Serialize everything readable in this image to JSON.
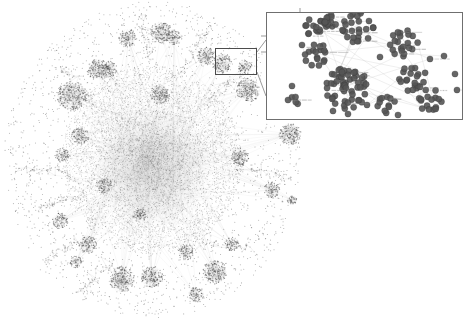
{
  "figure": {
    "background_color": "#ffffff",
    "node_color": "#4a4a4a",
    "edge_color": "#9a9a9a",
    "inset_border_color": "#6f6f6f",
    "selection_border_color": "#4c4c4c",
    "connector_color": "#6f6f6f",
    "caption": "",
    "width": 474,
    "height": 320
  },
  "main_graph": {
    "name": "main-network-hairball",
    "center_x": 152,
    "center_y": 160,
    "core_radius": 78,
    "node_count": 9000,
    "edge_count": 14000,
    "satellite_clusters": [
      {
        "x": 72,
        "y": 96,
        "r": 15,
        "n": 190
      },
      {
        "x": 98,
        "y": 70,
        "r": 11,
        "n": 120
      },
      {
        "x": 128,
        "y": 38,
        "r": 9,
        "n": 85
      },
      {
        "x": 161,
        "y": 32,
        "r": 11,
        "n": 115
      },
      {
        "x": 174,
        "y": 37,
        "r": 8,
        "n": 70
      },
      {
        "x": 206,
        "y": 56,
        "r": 9,
        "n": 85
      },
      {
        "x": 222,
        "y": 63,
        "r": 10,
        "n": 95
      },
      {
        "x": 245,
        "y": 67,
        "r": 7,
        "n": 55
      },
      {
        "x": 248,
        "y": 90,
        "r": 12,
        "n": 140
      },
      {
        "x": 290,
        "y": 134,
        "r": 11,
        "n": 130
      },
      {
        "x": 272,
        "y": 190,
        "r": 8,
        "n": 70
      },
      {
        "x": 292,
        "y": 200,
        "r": 5,
        "n": 35
      },
      {
        "x": 240,
        "y": 157,
        "r": 9,
        "n": 90
      },
      {
        "x": 109,
        "y": 69,
        "r": 8,
        "n": 70
      },
      {
        "x": 80,
        "y": 136,
        "r": 9,
        "n": 80
      },
      {
        "x": 62,
        "y": 155,
        "r": 7,
        "n": 55
      },
      {
        "x": 60,
        "y": 221,
        "r": 8,
        "n": 70
      },
      {
        "x": 88,
        "y": 245,
        "r": 9,
        "n": 85
      },
      {
        "x": 76,
        "y": 262,
        "r": 6,
        "n": 45
      },
      {
        "x": 122,
        "y": 279,
        "r": 13,
        "n": 160
      },
      {
        "x": 152,
        "y": 277,
        "r": 11,
        "n": 125
      },
      {
        "x": 215,
        "y": 272,
        "r": 12,
        "n": 145
      },
      {
        "x": 196,
        "y": 295,
        "r": 8,
        "n": 65
      },
      {
        "x": 186,
        "y": 252,
        "r": 8,
        "n": 70
      },
      {
        "x": 232,
        "y": 244,
        "r": 7,
        "n": 55
      },
      {
        "x": 140,
        "y": 215,
        "r": 7,
        "n": 55
      },
      {
        "x": 104,
        "y": 185,
        "r": 8,
        "n": 65
      },
      {
        "x": 160,
        "y": 95,
        "r": 10,
        "n": 100
      }
    ],
    "filament_tendrils": [
      {
        "x1": 70,
        "y1": 172,
        "x2": 18,
        "y2": 168
      },
      {
        "x1": 78,
        "y1": 196,
        "x2": 36,
        "y2": 206
      },
      {
        "x1": 84,
        "y1": 238,
        "x2": 42,
        "y2": 262
      },
      {
        "x1": 110,
        "y1": 262,
        "x2": 78,
        "y2": 292
      },
      {
        "x1": 190,
        "y1": 246,
        "x2": 254,
        "y2": 246
      },
      {
        "x1": 206,
        "y1": 100,
        "x2": 246,
        "y2": 72
      },
      {
        "x1": 150,
        "y1": 62,
        "x2": 140,
        "y2": 16
      },
      {
        "x1": 182,
        "y1": 72,
        "x2": 210,
        "y2": 24
      },
      {
        "x1": 96,
        "y1": 104,
        "x2": 60,
        "y2": 66
      },
      {
        "x1": 236,
        "y1": 168,
        "x2": 286,
        "y2": 176
      }
    ]
  },
  "inset": {
    "name": "magnified-inset",
    "x": 266,
    "y": 12,
    "width": 197,
    "height": 108,
    "node_radius_px": 3.1,
    "clusters": [
      {
        "id": "c1",
        "x": 314,
        "y": 27,
        "r": 9,
        "n": 13,
        "label": "cluster-top-left"
      },
      {
        "id": "c2",
        "x": 327,
        "y": 26,
        "r": 6,
        "n": 7,
        "label": "cluster-top-left-b"
      },
      {
        "id": "c3",
        "x": 330,
        "y": 22,
        "r": 7,
        "n": 9,
        "label": "cluster-top-mid"
      },
      {
        "id": "c4",
        "x": 358,
        "y": 27,
        "r": 16,
        "n": 26,
        "label": "cluster-top-center"
      },
      {
        "id": "c5",
        "x": 316,
        "y": 55,
        "r": 12,
        "n": 17,
        "label": "cluster-left-mid"
      },
      {
        "id": "c6",
        "x": 404,
        "y": 44,
        "r": 14,
        "n": 21,
        "label": "cluster-right-upper"
      },
      {
        "id": "c7",
        "x": 347,
        "y": 88,
        "r": 21,
        "n": 56,
        "label": "cluster-center-large"
      },
      {
        "id": "c8",
        "x": 413,
        "y": 78,
        "r": 14,
        "n": 20,
        "label": "cluster-right-mid"
      },
      {
        "id": "c9",
        "x": 430,
        "y": 100,
        "r": 12,
        "n": 16,
        "label": "cluster-right-lower"
      },
      {
        "id": "c10",
        "x": 386,
        "y": 104,
        "r": 9,
        "n": 11,
        "label": "cluster-bottom-mid"
      },
      {
        "id": "c11",
        "x": 295,
        "y": 100,
        "r": 5,
        "n": 4,
        "label": "cluster-bottom-left"
      }
    ],
    "free_nodes": [
      {
        "x": 302,
        "y": 45
      },
      {
        "x": 292,
        "y": 86
      },
      {
        "x": 288,
        "y": 100
      },
      {
        "x": 430,
        "y": 59
      },
      {
        "x": 444,
        "y": 56
      },
      {
        "x": 457,
        "y": 90
      },
      {
        "x": 380,
        "y": 57
      },
      {
        "x": 367,
        "y": 105
      },
      {
        "x": 398,
        "y": 115
      },
      {
        "x": 455,
        "y": 74
      },
      {
        "x": 333,
        "y": 111
      },
      {
        "x": 348,
        "y": 114
      }
    ],
    "label_count": 34,
    "label_color": "#8a8a8a",
    "tick_marks": [
      {
        "side": "left",
        "y": 36
      },
      {
        "side": "left",
        "y": 52
      },
      {
        "side": "top",
        "x": 300
      }
    ]
  },
  "connectors": {
    "name": "inset-leader-lines",
    "lines": [
      {
        "x1": 257,
        "y1": 52,
        "x2": 266,
        "y2": 40
      },
      {
        "x1": 257,
        "y1": 72,
        "x2": 266,
        "y2": 96
      }
    ]
  },
  "selection": {
    "name": "selection-rectangle",
    "x": 215,
    "y": 48,
    "width": 42,
    "height": 27
  }
}
